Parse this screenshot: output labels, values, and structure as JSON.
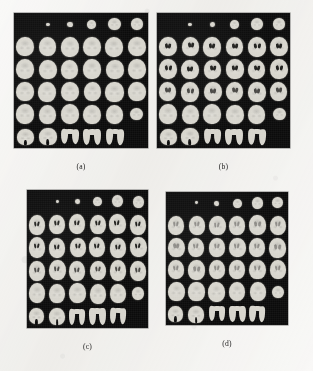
{
  "figure": {
    "background_color": "#f2f1ee",
    "panel_background_color": "#0b0b0b",
    "tissue_color": "#d7d5cd",
    "caption_color": "#1d1d1d",
    "panel_count": 4,
    "layout": "2x2 panel grid of axial brain MRI slice montages"
  },
  "panels": [
    {
      "id": "panel-a",
      "caption": "(a)",
      "grid_rows": 6,
      "grid_cols": 6,
      "slice_count": 34,
      "ventricle_contrast": "none",
      "x": 14,
      "y": 13,
      "width": 134,
      "height": 135
    },
    {
      "id": "panel-b",
      "caption": "(b)",
      "grid_rows": 6,
      "grid_cols": 6,
      "slice_count": 34,
      "ventricle_contrast": "strong",
      "x": 157,
      "y": 13,
      "width": 133,
      "height": 135
    },
    {
      "id": "panel-c",
      "caption": "(c)",
      "grid_rows": 6,
      "grid_cols": 6,
      "slice_count": 34,
      "ventricle_contrast": "strong",
      "x": 27,
      "y": 190,
      "width": 121,
      "height": 138
    },
    {
      "id": "panel-d",
      "caption": "(d)",
      "grid_rows": 6,
      "grid_cols": 6,
      "slice_count": 34,
      "ventricle_contrast": "faint",
      "x": 166,
      "y": 192,
      "width": 122,
      "height": 133
    }
  ],
  "captions": {
    "a": "(a)",
    "b": "(b)",
    "c": "(c)",
    "d": "(d)"
  },
  "slice_maps": {
    "panel_a": [
      [
        "empty",
        "dot-xs",
        "dot-sm",
        "round-sm",
        "round-md",
        "round-md"
      ],
      [
        "ovoid",
        "ovoid",
        "ovoid",
        "ovoid",
        "ovoid",
        "ovoid"
      ],
      [
        "ovoid",
        "ovoid",
        "ovoid",
        "ovoid",
        "ovoid",
        "ovoid"
      ],
      [
        "ovoid",
        "ovoid",
        "ovoid",
        "ovoid",
        "ovoid",
        "ovoid"
      ],
      [
        "ovoid",
        "ovoid",
        "ovoid",
        "ovoid",
        "ovoid",
        "round-md"
      ],
      [
        "lobed",
        "lobed",
        "ushape",
        "ushape",
        "ushape",
        "empty"
      ]
    ],
    "panel_b": [
      [
        "empty",
        "dot-xs",
        "dot-sm",
        "round-sm",
        "round-md",
        "round-md"
      ],
      [
        "ovoid",
        "ovoid",
        "ovoid",
        "ovoid",
        "ovoid",
        "ovoid"
      ],
      [
        "ovoid",
        "ovoid",
        "ovoid",
        "ovoid",
        "ovoid",
        "ovoid"
      ],
      [
        "ovoid",
        "ovoid",
        "ovoid",
        "ovoid",
        "ovoid",
        "ovoid"
      ],
      [
        "ovoid",
        "ovoid",
        "ovoid",
        "ovoid",
        "ovoid",
        "round-md"
      ],
      [
        "lobed",
        "lobed",
        "ushape",
        "ushape",
        "ushape",
        "empty"
      ]
    ],
    "panel_c": [
      [
        "empty",
        "dot-xs",
        "dot-sm",
        "round-sm",
        "round-md",
        "round-md"
      ],
      [
        "ovoid",
        "ovoid",
        "ovoid",
        "ovoid",
        "ovoid",
        "ovoid"
      ],
      [
        "ovoid",
        "ovoid",
        "ovoid",
        "ovoid",
        "ovoid",
        "ovoid"
      ],
      [
        "ovoid",
        "ovoid",
        "ovoid",
        "ovoid",
        "ovoid",
        "ovoid"
      ],
      [
        "ovoid",
        "ovoid",
        "ovoid",
        "ovoid",
        "ovoid",
        "round-md"
      ],
      [
        "lobed",
        "lobed",
        "ushape",
        "ushape",
        "ushape",
        "empty"
      ]
    ],
    "panel_d": [
      [
        "empty",
        "dot-xs",
        "dot-sm",
        "round-sm",
        "round-md",
        "round-md"
      ],
      [
        "ovoid",
        "ovoid",
        "ovoid",
        "ovoid",
        "ovoid",
        "ovoid"
      ],
      [
        "ovoid",
        "ovoid",
        "ovoid",
        "ovoid",
        "ovoid",
        "ovoid"
      ],
      [
        "ovoid",
        "ovoid",
        "ovoid",
        "ovoid",
        "ovoid",
        "ovoid"
      ],
      [
        "ovoid",
        "ovoid",
        "ovoid",
        "ovoid",
        "ovoid",
        "round-md"
      ],
      [
        "lobed",
        "lobed",
        "ushape",
        "ushape",
        "ushape",
        "empty"
      ]
    ]
  }
}
